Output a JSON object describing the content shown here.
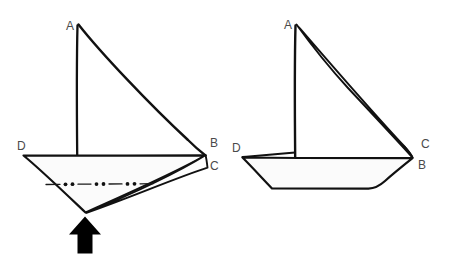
{
  "diagram": {
    "type": "line-drawing",
    "background_color": "#ffffff",
    "ink_color": "#111111",
    "label_color": "#4a4a4a",
    "figures": [
      {
        "id": "left-figure",
        "name": "deep-v-hull-sailboat",
        "labels": {
          "a": "A",
          "b": "B",
          "c": "C",
          "d": "D"
        },
        "label_positions": {
          "a": {
            "x": 66,
            "y": 30
          },
          "b": {
            "x": 210,
            "y": 147
          },
          "c": {
            "x": 210,
            "y": 170
          },
          "d": {
            "x": 17,
            "y": 150
          }
        },
        "annotations": {
          "centerline": "dash-dot-dot centerline",
          "arrow": "upward pointing arrow at keel"
        }
      },
      {
        "id": "right-figure",
        "name": "flat-bottom-hull-sailboat",
        "labels": {
          "a": "A",
          "b": "B",
          "c": "C",
          "d": "D"
        },
        "label_positions": {
          "a": {
            "x": 286,
            "y": 29
          },
          "b": {
            "x": 418,
            "y": 167
          },
          "c": {
            "x": 421,
            "y": 147
          },
          "d": {
            "x": 234,
            "y": 151
          }
        },
        "annotations": {
          "centerline": "",
          "arrow": ""
        }
      }
    ]
  }
}
